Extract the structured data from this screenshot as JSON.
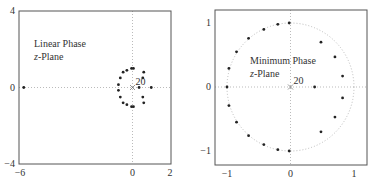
{
  "chart_data": [
    {
      "type": "scatter",
      "title": "",
      "annotation": [
        "Linear Phase",
        "z-Plane"
      ],
      "pole_label": "20",
      "xlim": [
        -6,
        2
      ],
      "ylim": [
        -4,
        4
      ],
      "xticks": [
        "-6",
        "0",
        "2"
      ],
      "yticks": [
        "4",
        "0",
        "-4"
      ],
      "grid": "dotted axes at 0",
      "zeros": [
        [
          -5.8,
          0
        ],
        [
          1.0,
          0
        ],
        [
          0.6,
          0.8
        ],
        [
          0.6,
          -0.8
        ],
        [
          0.55,
          0.5
        ],
        [
          0.55,
          -0.5
        ],
        [
          0.35,
          0
        ],
        [
          -0.05,
          1.0
        ],
        [
          0.05,
          1.0
        ],
        [
          -0.3,
          0.9
        ],
        [
          -0.5,
          0.8
        ],
        [
          -0.65,
          0.5
        ],
        [
          -0.75,
          0.15
        ],
        [
          -0.75,
          -0.15
        ],
        [
          -0.65,
          -0.5
        ],
        [
          -0.5,
          -0.8
        ],
        [
          -0.3,
          -0.9
        ],
        [
          -0.05,
          -1.0
        ],
        [
          0.05,
          -1.0
        ]
      ],
      "poles": [
        [
          0,
          0
        ]
      ]
    },
    {
      "type": "scatter",
      "title": "",
      "annotation": [
        "Minimum Phase",
        "z-Plane"
      ],
      "pole_label": "20",
      "xlim": [
        -1.2,
        1.2
      ],
      "ylim": [
        -1.2,
        1.2
      ],
      "xticks": [
        "-1",
        "0",
        "1"
      ],
      "yticks": [
        "1",
        "0",
        "-1"
      ],
      "unit_circle": true,
      "zeros": [
        [
          0.38,
          0
        ],
        [
          0.82,
          0.17
        ],
        [
          0.82,
          -0.17
        ],
        [
          0.7,
          0.47
        ],
        [
          0.7,
          -0.47
        ],
        [
          0.48,
          0.7
        ],
        [
          0.48,
          -0.7
        ],
        [
          -0.02,
          1.0
        ],
        [
          -0.2,
          0.98
        ],
        [
          -0.42,
          0.9
        ],
        [
          -0.66,
          0.76
        ],
        [
          -0.85,
          0.55
        ],
        [
          -0.97,
          0.29
        ],
        [
          -1.0,
          0
        ],
        [
          -0.97,
          -0.29
        ],
        [
          -0.85,
          -0.55
        ],
        [
          -0.66,
          -0.76
        ],
        [
          -0.42,
          -0.9
        ],
        [
          -0.2,
          -0.98
        ],
        [
          -0.02,
          -1.0
        ]
      ],
      "poles": [
        [
          0,
          0
        ]
      ]
    }
  ]
}
